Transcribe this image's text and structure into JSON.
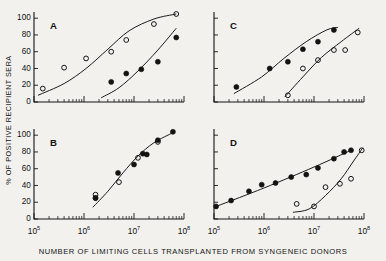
{
  "figure": {
    "xlabel": "NUMBER OF LIMITING CELLS TRANSPLANTED FROM SYNGENEIC DONORS",
    "ylabel": "% OF POSITIVE RECIPIENT SERA",
    "x_tick_labels": [
      "10",
      "10",
      "10",
      "10"
    ],
    "x_tick_exponents": [
      "5",
      "6",
      "7",
      "8"
    ],
    "y_tick_labels": [
      "0",
      "20",
      "40",
      "60",
      "80",
      "100"
    ],
    "panel_letters": [
      "A",
      "B",
      "C",
      "D"
    ]
  },
  "chart_data": {
    "type": "scatter",
    "title": "",
    "xlabel": "NUMBER OF LIMITING CELLS TRANSPLANTED FROM SYNGENEIC DONORS",
    "ylabel": "% OF POSITIVE RECIPIENT SERA",
    "xscale": "log",
    "xlim": [
      100000,
      100000000
    ],
    "ylim": [
      0,
      105
    ],
    "yticks": [
      0,
      20,
      40,
      60,
      80,
      100
    ],
    "xticks": [
      100000,
      1000000,
      10000000,
      100000000
    ],
    "grid": false,
    "legend": false,
    "panels": [
      {
        "label": "A",
        "series": [
          {
            "name": "open",
            "marker": "open-circle",
            "x": [
              150000,
              400000,
              1100000,
              3500000,
              7000000,
              25000000,
              70000000
            ],
            "y": [
              16,
              41,
              52,
              60,
              74,
              93,
              105
            ]
          },
          {
            "name": "filled",
            "marker": "filled-circle",
            "x": [
              3500000,
              7000000,
              14000000,
              30000000,
              70000000
            ],
            "y": [
              24,
              34,
              39,
              48,
              77
            ]
          }
        ],
        "curves": [
          {
            "name": "open-fit",
            "x": [
              120000,
              400000,
              1100000,
              3000000,
              8000000,
              25000000,
              70000000
            ],
            "y": [
              8,
              22,
              40,
              63,
              85,
              99,
              105
            ]
          },
          {
            "name": "filled-fit",
            "x": [
              2200000,
              5000000,
              12000000,
              30000000,
              70000000
            ],
            "y": [
              5,
              17,
              37,
              62,
              88
            ]
          }
        ]
      },
      {
        "label": "B",
        "series": [
          {
            "name": "open",
            "marker": "open-circle",
            "x": [
              1700000,
              1700000,
              5000000,
              12000000,
              30000000
            ],
            "y": [
              29,
              25,
              44,
              73,
              92
            ]
          },
          {
            "name": "filled",
            "marker": "filled-circle",
            "x": [
              1700000,
              4800000,
              10000000,
              15000000,
              18000000,
              30000000,
              60000000
            ],
            "y": [
              25,
              55,
              65,
              78,
              77,
              94,
              104
            ]
          }
        ],
        "curves": [
          {
            "name": "fit",
            "x": [
              1500000,
              3000000,
              6000000,
              12000000,
              25000000,
              60000000
            ],
            "y": [
              14,
              33,
              55,
              75,
              91,
              103
            ]
          }
        ]
      },
      {
        "label": "C",
        "series": [
          {
            "name": "filled",
            "marker": "filled-circle",
            "x": [
              280000,
              1300000,
              3000000,
              6000000,
              12000000,
              25000000
            ],
            "y": [
              18,
              40,
              48,
              63,
              72,
              86
            ]
          },
          {
            "name": "open",
            "marker": "open-circle",
            "x": [
              3000000,
              6000000,
              12000000,
              25000000,
              42000000,
              75000000
            ],
            "y": [
              8,
              40,
              50,
              62,
              62,
              83
            ]
          }
        ],
        "curves": [
          {
            "name": "filled-fit",
            "x": [
              250000,
              900000,
              2500000,
              7000000,
              18000000,
              30000000
            ],
            "y": [
              10,
              30,
              52,
              72,
              86,
              89
            ]
          },
          {
            "name": "open-fit",
            "x": [
              2600000,
              6000000,
              14000000,
              35000000,
              80000000
            ],
            "y": [
              6,
              30,
              53,
              72,
              88
            ]
          }
        ]
      },
      {
        "label": "D",
        "series": [
          {
            "name": "filled",
            "marker": "filled-circle",
            "x": [
              110000,
              220000,
              500000,
              900000,
              1700000,
              3500000,
              7000000,
              12000000,
              25000000,
              40000000,
              55000000
            ],
            "y": [
              15,
              22,
              33,
              41,
              43,
              50,
              53,
              61,
              72,
              80,
              82
            ]
          },
          {
            "name": "open",
            "marker": "open-circle",
            "x": [
              4500000,
              10000000,
              17000000,
              33000000,
              55000000,
              90000000
            ],
            "y": [
              18,
              15,
              38,
              42,
              48,
              82
            ]
          }
        ],
        "curves": [
          {
            "name": "filled-fit",
            "x": [
              100000,
              1000000,
              10000000,
              55000000
            ],
            "y": [
              14,
              37,
              62,
              82
            ]
          },
          {
            "name": "open-fit",
            "x": [
              3800000,
              8000000,
              17000000,
              35000000,
              60000000,
              95000000
            ],
            "y": [
              8,
              12,
              28,
              48,
              68,
              85
            ]
          }
        ]
      }
    ]
  }
}
